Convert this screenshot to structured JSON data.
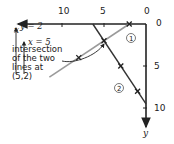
{
  "orientation": "rotated 180 degrees",
  "axes": {
    "x_label": "x",
    "y_label": "y",
    "origin_label_x": "0",
    "origin_label_y": "0",
    "x_ticks": [
      {
        "value": 5,
        "label": "5"
      },
      {
        "value": 10,
        "label": "10"
      }
    ],
    "y_ticks": [
      {
        "value": 5,
        "label": "5"
      },
      {
        "value": 10,
        "label": "10"
      }
    ]
  },
  "lines": [
    {
      "id": "1",
      "label": "1",
      "color": "#9a9a9a",
      "from": [
        2,
        0
      ],
      "to": [
        11.5,
        6.33
      ],
      "marks": [
        [
          2,
          0
        ],
        [
          8,
          4
        ]
      ]
    },
    {
      "id": "2",
      "label": "2",
      "color": "#333333",
      "from": [
        0,
        9.5
      ],
      "to": [
        6.33,
        0
      ],
      "marks": [
        [
          3,
          5
        ],
        [
          1,
          8
        ]
      ]
    }
  ],
  "intersection": {
    "point": [
      5,
      2
    ],
    "annotation_lines": [
      "intersection",
      "of the two",
      "lines at",
      "(5,2)"
    ],
    "arrow_x_text": "x = 5",
    "arrow_y_text": "y = 2"
  },
  "colors": {
    "axis": "#222222",
    "line1": "#9a9a9a",
    "line2": "#333333"
  }
}
